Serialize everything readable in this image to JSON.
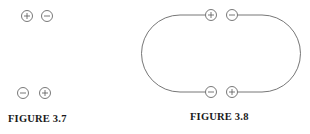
{
  "figures": [
    {
      "id": "fig-3-7",
      "caption": "FIGURE 3.7",
      "charges": [
        {
          "sign": "+",
          "x": 27,
          "y": 16
        },
        {
          "sign": "−",
          "x": 47,
          "y": 16
        },
        {
          "sign": "−",
          "x": 23,
          "y": 93
        },
        {
          "sign": "+",
          "x": 45,
          "y": 93
        }
      ]
    },
    {
      "id": "fig-3-8",
      "caption": "FIGURE 3.8",
      "charges": [
        {
          "sign": "+",
          "x": 211,
          "y": 15
        },
        {
          "sign": "−",
          "x": 232,
          "y": 15
        },
        {
          "sign": "−",
          "x": 211,
          "y": 92
        },
        {
          "sign": "+",
          "x": 232,
          "y": 92
        }
      ],
      "wire": "closed loop connecting charge pairs"
    }
  ],
  "colors": {
    "line": "#666666",
    "text": "#1a1a1a"
  }
}
